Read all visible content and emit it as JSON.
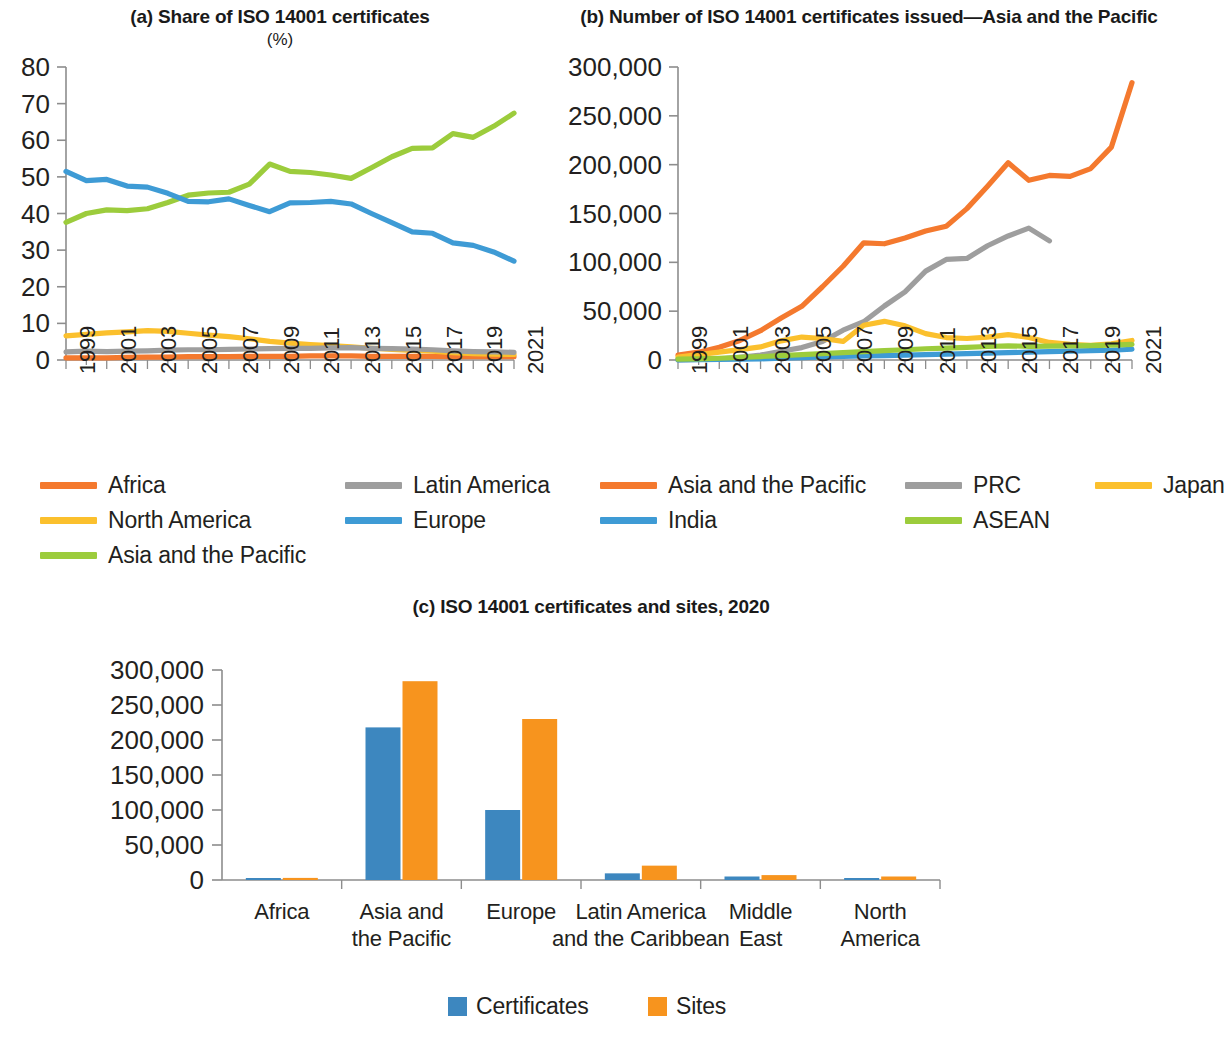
{
  "figure": {
    "panels": [
      {
        "id": "a",
        "title": "(a) Share of ISO 14001 certificates",
        "subtitle": "(%)"
      },
      {
        "id": "b",
        "title": "(b) Number of ISO 14001 certificates issued—Asia and the Pacific",
        "subtitle": ""
      },
      {
        "id": "c",
        "title": "(c) ISO 14001 certificates and sites, 2020",
        "subtitle": ""
      }
    ]
  },
  "colors": {
    "orange": "#F4792E",
    "amber": "#FBC02D",
    "green": "#9CCC3C",
    "gray": "#9E9E9E",
    "blue": "#3E9BD5",
    "bar_blue": "#3D87BF",
    "bar_orange": "#F7941E",
    "axis": "#8d8d8d",
    "text": "#231f20"
  },
  "chart_data": [
    {
      "type": "line",
      "panel": "a",
      "title": "(a) Share of ISO 14001 certificates",
      "subtitle": "(%)",
      "xlabel": "",
      "ylabel": "(%)",
      "ylim": [
        0,
        80
      ],
      "yticks": [
        0,
        10,
        20,
        30,
        40,
        50,
        60,
        70,
        80
      ],
      "ytick_labels": [
        "0",
        "10",
        "20",
        "30",
        "40",
        "50",
        "60",
        "70",
        "80"
      ],
      "grid": false,
      "legend_position": "below",
      "x": [
        1999,
        2000,
        2001,
        2002,
        2003,
        2004,
        2005,
        2006,
        2007,
        2008,
        2009,
        2010,
        2011,
        2012,
        2013,
        2014,
        2015,
        2016,
        2017,
        2018,
        2019,
        2020,
        2021
      ],
      "xtick_labels": [
        "1999",
        "2001",
        "2003",
        "2005",
        "2007",
        "2009",
        "2011",
        "2013",
        "2015",
        "2017",
        "2019",
        "2021"
      ],
      "series": [
        {
          "name": "Africa",
          "color": "#F4792E",
          "values": [
            0.6,
            0.6,
            0.6,
            0.7,
            0.8,
            0.8,
            0.9,
            0.9,
            0.9,
            1.0,
            1.0,
            1.0,
            1.1,
            1.1,
            1.1,
            1.0,
            1.0,
            1.0,
            1.0,
            0.9,
            0.9,
            0.9,
            0.9
          ]
        },
        {
          "name": "North America",
          "color": "#FBC02D",
          "values": [
            6.6,
            7.0,
            7.4,
            7.7,
            8.0,
            7.8,
            7.3,
            6.8,
            6.4,
            5.8,
            5.1,
            4.6,
            4.2,
            3.9,
            3.6,
            3.2,
            2.9,
            2.6,
            2.4,
            2.0,
            1.7,
            1.6,
            1.5
          ]
        },
        {
          "name": "Asia and the Pacific",
          "color": "#9CCC3C",
          "values": [
            37.6,
            40.0,
            41.0,
            40.8,
            41.3,
            43.0,
            45.0,
            45.6,
            45.8,
            48.0,
            53.5,
            51.5,
            51.2,
            50.5,
            49.6,
            52.5,
            55.5,
            57.8,
            57.9,
            61.8,
            60.8,
            63.8,
            67.4
          ]
        },
        {
          "name": "Latin America",
          "color": "#9E9E9E",
          "values": [
            2.2,
            2.4,
            2.3,
            2.4,
            2.5,
            2.7,
            2.8,
            2.8,
            2.9,
            3.0,
            3.1,
            3.2,
            3.2,
            3.3,
            3.4,
            3.2,
            3.1,
            3.0,
            2.8,
            2.5,
            2.3,
            2.2,
            2.1
          ]
        },
        {
          "name": "Europe",
          "color": "#3E9BD5",
          "values": [
            51.5,
            49.0,
            49.3,
            47.5,
            47.2,
            45.5,
            43.3,
            43.2,
            44.0,
            42.2,
            40.5,
            42.9,
            43.0,
            43.3,
            42.6,
            40.0,
            37.5,
            35.0,
            34.6,
            32.0,
            31.3,
            29.5,
            27.0
          ]
        }
      ]
    },
    {
      "type": "line",
      "panel": "b",
      "title": "(b) Number of ISO 14001 certificates issued—Asia and the Pacific",
      "subtitle": "",
      "xlabel": "",
      "ylabel": "",
      "ylim": [
        0,
        300000
      ],
      "yticks": [
        0,
        50000,
        100000,
        150000,
        200000,
        250000,
        300000
      ],
      "ytick_labels": [
        "0",
        "50,000",
        "100,000",
        "150,000",
        "200,000",
        "250,000",
        "300,000"
      ],
      "grid": false,
      "legend_position": "below",
      "x": [
        1999,
        2000,
        2001,
        2002,
        2003,
        2004,
        2005,
        2006,
        2007,
        2008,
        2009,
        2010,
        2011,
        2012,
        2013,
        2014,
        2015,
        2016,
        2017,
        2018,
        2019,
        2020,
        2021
      ],
      "xtick_labels": [
        "1999",
        "2001",
        "2003",
        "2005",
        "2007",
        "2009",
        "2011",
        "2013",
        "2015",
        "2017",
        "2019",
        "2021"
      ],
      "series": [
        {
          "name": "Asia and the Pacific",
          "color": "#F4792E",
          "values": [
            5000,
            8000,
            13000,
            20000,
            30000,
            43000,
            55000,
            75000,
            96000,
            120000,
            119000,
            125000,
            132000,
            137000,
            155000,
            178000,
            202000,
            184000,
            189000,
            188000,
            196000,
            218000,
            284000
          ]
        },
        {
          "name": "PRC",
          "color": "#9E9E9E",
          "values": [
            200,
            500,
            1000,
            2800,
            5000,
            8900,
            12700,
            18900,
            30500,
            39200,
            55300,
            69800,
            91000,
            103000,
            104000,
            117000,
            127000,
            135000,
            122000,
            null,
            null,
            null,
            null
          ]
        },
        {
          "name": "Japan",
          "color": "#FBC02D",
          "values": [
            3000,
            5500,
            8100,
            10600,
            13400,
            19600,
            23500,
            22000,
            19000,
            35600,
            39600,
            35000,
            27000,
            23000,
            22000,
            23500,
            26000,
            23000,
            18000,
            16000,
            15000,
            16500,
            20000
          ]
        },
        {
          "name": "India",
          "color": "#3E9BD5",
          "values": [
            200,
            300,
            500,
            800,
            1200,
            1800,
            2500,
            3200,
            3800,
            4200,
            4500,
            5000,
            5500,
            6000,
            6500,
            7000,
            7500,
            8000,
            8500,
            9000,
            9500,
            10000,
            11000
          ]
        },
        {
          "name": "ASEAN",
          "color": "#9CCC3C",
          "values": [
            800,
            1200,
            1800,
            2600,
            3500,
            4500,
            5500,
            6500,
            7500,
            8500,
            9500,
            10500,
            11500,
            12200,
            13000,
            13800,
            14500,
            14000,
            14200,
            14500,
            14800,
            15200,
            16000
          ]
        }
      ]
    },
    {
      "type": "bar",
      "panel": "c",
      "title": "(c) ISO 14001 certificates and sites, 2020",
      "subtitle": "",
      "xlabel": "",
      "ylabel": "",
      "ylim": [
        0,
        300000
      ],
      "yticks": [
        0,
        50000,
        100000,
        150000,
        200000,
        250000,
        300000
      ],
      "ytick_labels": [
        "0",
        "50,000",
        "100,000",
        "150,000",
        "200,000",
        "250,000",
        "300,000"
      ],
      "grid": false,
      "legend_position": "below",
      "categories": [
        "Africa",
        "Asia and\nthe Pacific",
        "Europe",
        "Latin America\nand the Caribbean",
        "Middle\nEast",
        "North\nAmerica"
      ],
      "category_lines": [
        [
          "Africa"
        ],
        [
          "Asia and",
          "the Pacific"
        ],
        [
          "Europe"
        ],
        [
          "Latin America",
          "and the Caribbean"
        ],
        [
          "Middle",
          "East"
        ],
        [
          "North",
          "America"
        ]
      ],
      "series": [
        {
          "name": "Certificates",
          "color": "#3D87BF",
          "values": [
            1800,
            218000,
            100000,
            9500,
            5000,
            2200
          ]
        },
        {
          "name": "Sites",
          "color": "#F7941E",
          "values": [
            3000,
            284000,
            230000,
            20500,
            7000,
            5000
          ]
        }
      ]
    }
  ],
  "legends": {
    "a": [
      {
        "label": "Africa",
        "color": "#F4792E",
        "col": 0,
        "row": 0
      },
      {
        "label": "North America",
        "color": "#FBC02D",
        "col": 0,
        "row": 1
      },
      {
        "label": "Asia and the Pacific",
        "color": "#9CCC3C",
        "col": 0,
        "row": 2
      },
      {
        "label": "Latin America",
        "color": "#9E9E9E",
        "col": 1,
        "row": 0
      },
      {
        "label": "Europe",
        "color": "#3E9BD5",
        "col": 1,
        "row": 1
      }
    ],
    "b": [
      {
        "label": "Asia and the Pacific",
        "color": "#F4792E",
        "col": 0,
        "row": 0
      },
      {
        "label": "PRC",
        "color": "#9E9E9E",
        "col": 1,
        "row": 0
      },
      {
        "label": "Japan",
        "color": "#FBC02D",
        "col": 2,
        "row": 0
      },
      {
        "label": "India",
        "color": "#3E9BD5",
        "col": 0,
        "row": 1
      },
      {
        "label": "ASEAN",
        "color": "#9CCC3C",
        "col": 1,
        "row": 1
      }
    ],
    "c": [
      {
        "label": "Certificates",
        "color": "#3D87BF"
      },
      {
        "label": "Sites",
        "color": "#F7941E"
      }
    ]
  }
}
